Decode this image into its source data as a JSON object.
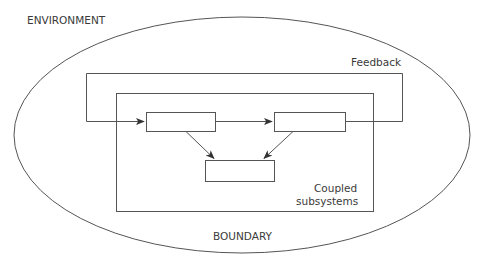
{
  "diagram": {
    "labels": {
      "environment": "ENVIRONMENT",
      "feedback": "Feedback",
      "coupled_line1": "Coupled",
      "coupled_line2": "subsystems",
      "boundary": "BOUNDARY"
    },
    "colors": {
      "stroke": "#555555",
      "text": "#3a3a3a",
      "background": "#ffffff"
    },
    "nodes": [
      {
        "id": "subsystem-a",
        "label": ""
      },
      {
        "id": "subsystem-b",
        "label": ""
      },
      {
        "id": "subsystem-c",
        "label": ""
      }
    ],
    "edges": [
      {
        "from": "input",
        "to": "subsystem-a"
      },
      {
        "from": "subsystem-a",
        "to": "subsystem-b"
      },
      {
        "from": "subsystem-a",
        "to": "subsystem-c"
      },
      {
        "from": "subsystem-b",
        "to": "subsystem-c"
      },
      {
        "from": "subsystem-b",
        "to": "feedback-loop"
      }
    ]
  }
}
